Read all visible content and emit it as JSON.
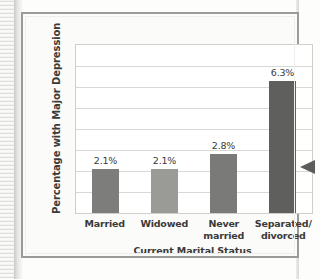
{
  "figure": {
    "frame_border_color": "#9a9a98",
    "background": "#fbfbfa"
  },
  "chart_data": {
    "type": "bar",
    "title": "",
    "xlabel": "Current Marital Status",
    "ylabel": "Percentage with Major Depression",
    "categories": [
      "Married",
      "Widowed",
      "Never\nmarried",
      "Separated/\ndivorced"
    ],
    "values": [
      2.1,
      2.1,
      2.8,
      6.3
    ],
    "value_labels": [
      "2.1%",
      "2.1%",
      "2.8%",
      "6.3%"
    ],
    "ylim": [
      0,
      8
    ],
    "y_gridline_count": 7,
    "y_tick_labels": [],
    "grid": true,
    "legend": "none",
    "bar_colors": [
      "#7d7d7b",
      "#9a9a97",
      "#7a7a78",
      "#5f5f5d"
    ]
  },
  "annotations": {
    "edge_arrow": "left-pointing-triangle"
  }
}
